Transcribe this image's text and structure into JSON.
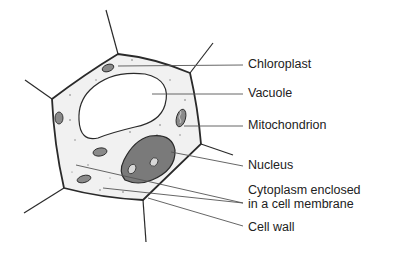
{
  "diagram": {
    "colors": {
      "outline": "#2a2a2a",
      "cytoplasm": "#f1f1f1",
      "vacuole": "#ffffff",
      "nucleus": "#7a7a7a",
      "organelle": "#8a8a8a",
      "leader_line": "#555555",
      "text": "#222222"
    },
    "labels": [
      {
        "id": "chloroplast",
        "text": "Chloroplast",
        "x": 248,
        "y": 57
      },
      {
        "id": "vacuole",
        "text": "Vacuole",
        "x": 248,
        "y": 86
      },
      {
        "id": "mitochondrion",
        "text": "Mitochondrion",
        "x": 248,
        "y": 118
      },
      {
        "id": "nucleus",
        "text": "Nucleus",
        "x": 248,
        "y": 158
      },
      {
        "id": "cytoplasm-line1",
        "text": "Cytoplasm enclosed",
        "x": 248,
        "y": 183
      },
      {
        "id": "cytoplasm-line2",
        "text": "in a cell membrane",
        "x": 248,
        "y": 197
      },
      {
        "id": "cell-wall",
        "text": "Cell wall",
        "x": 248,
        "y": 220
      }
    ]
  }
}
